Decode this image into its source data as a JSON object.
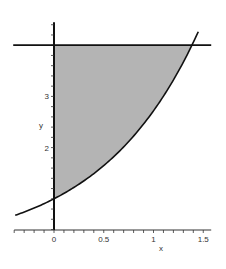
{
  "chart_data": {
    "type": "area",
    "title": "",
    "xlabel": "x",
    "ylabel": "y",
    "xlim": [
      -0.4,
      1.58
    ],
    "ylim": [
      0.4,
      4.45
    ],
    "x_ticks": [
      0,
      0.5,
      1,
      1.5
    ],
    "x_tick_labels": [
      "0",
      "0.5",
      "1",
      "1.5"
    ],
    "y_ticks": [
      2,
      3
    ],
    "y_tick_labels": [
      "2",
      "3"
    ],
    "grid": false,
    "legend": null,
    "series": [
      {
        "name": "y = e^x",
        "type": "line",
        "function": "exp(x)",
        "x_range": [
          -0.39,
          1.45
        ]
      },
      {
        "name": "y = 4",
        "type": "line",
        "function": "4",
        "x_range": [
          -0.41,
          1.58
        ]
      }
    ],
    "shaded_region": {
      "description": "region bounded by x = 0, y = 4 and y = e^x",
      "x_range": [
        0,
        1.386
      ],
      "lower": "exp(x)",
      "upper": 4,
      "color": "#b4b4b4"
    },
    "colors": {
      "curve": "#111111",
      "shade": "#b4b4b4",
      "axis": "#111111"
    }
  }
}
